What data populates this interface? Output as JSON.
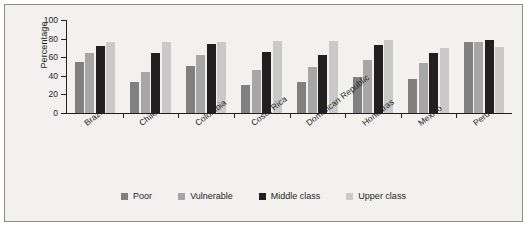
{
  "chart_data": {
    "type": "bar",
    "title": "",
    "subtitle": "",
    "xlabel": "",
    "ylabel": "Percentage",
    "ylim": [
      0,
      100
    ],
    "yticks": [
      0,
      20,
      40,
      60,
      80,
      100
    ],
    "ytick_labels": [
      "0",
      "20",
      "40",
      "60",
      "80",
      "100"
    ],
    "grid": false,
    "legend_position": "bottom",
    "categories": [
      "Brazil",
      "Chile",
      "Colombia",
      "Costa Rica",
      "Dominican Republic",
      "Honduras",
      "Mexico",
      "Peru"
    ],
    "series": [
      {
        "name": "Poor",
        "color": "#808080",
        "values": [
          55,
          33,
          51,
          30,
          33,
          39,
          37,
          76
        ]
      },
      {
        "name": "Vulnerable",
        "color": "#a6a6a6",
        "values": [
          64,
          44,
          62,
          46,
          50,
          57,
          54,
          76
        ]
      },
      {
        "name": "Middle class",
        "color": "#231f20",
        "values": [
          72,
          64,
          74,
          66,
          62,
          73,
          65,
          78
        ]
      },
      {
        "name": "Upper class",
        "color": "#c9c9c9",
        "values": [
          76,
          76,
          76,
          77,
          77,
          78,
          70,
          71
        ]
      }
    ]
  },
  "legend": {
    "items": [
      {
        "label": "Poor",
        "color": "#808080"
      },
      {
        "label": "Vulnerable",
        "color": "#a6a6a6"
      },
      {
        "label": "Middle class",
        "color": "#231f20"
      },
      {
        "label": "Upper class",
        "color": "#c9c9c9"
      }
    ]
  },
  "colors": {
    "background": "#f2f1ef",
    "frame": "#8c8c8c",
    "axis": "#231f20",
    "text": "#231f20"
  }
}
